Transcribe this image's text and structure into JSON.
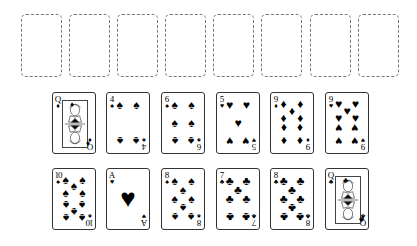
{
  "foundations": [
    {
      "label": ""
    },
    {
      "label": ""
    },
    {
      "label": ""
    },
    {
      "label": ""
    },
    {
      "label": ""
    },
    {
      "label": ""
    },
    {
      "label": ""
    },
    {
      "label": ""
    }
  ],
  "tableau": {
    "row1": [
      {
        "rank": "Q",
        "suit": "♦",
        "suit_name": "diamonds",
        "type": "face"
      },
      {
        "rank": "4",
        "suit": "♠",
        "suit_name": "spades",
        "type": "pips"
      },
      {
        "rank": "6",
        "suit": "♠",
        "suit_name": "spades",
        "type": "pips"
      },
      {
        "rank": "5",
        "suit": "♥",
        "suit_name": "hearts",
        "type": "pips"
      },
      {
        "rank": "9",
        "suit": "♦",
        "suit_name": "diamonds",
        "type": "pips"
      },
      {
        "rank": "9",
        "suit": "♥",
        "suit_name": "hearts",
        "type": "pips"
      }
    ],
    "row2": [
      {
        "rank": "10",
        "suit": "♠",
        "suit_name": "spades",
        "type": "pips"
      },
      {
        "rank": "A",
        "suit": "♥",
        "suit_name": "hearts",
        "type": "ace"
      },
      {
        "rank": "8",
        "suit": "♠",
        "suit_name": "spades",
        "type": "pips"
      },
      {
        "rank": "7",
        "suit": "♣",
        "suit_name": "clubs",
        "type": "pips"
      },
      {
        "rank": "8",
        "suit": "♣",
        "suit_name": "clubs",
        "type": "pips"
      },
      {
        "rank": "Q",
        "suit": "♣",
        "suit_name": "clubs",
        "type": "face"
      }
    ]
  },
  "colors": {
    "card_ink": "#000000",
    "slot_border": "#777777",
    "background": "#ffffff"
  }
}
